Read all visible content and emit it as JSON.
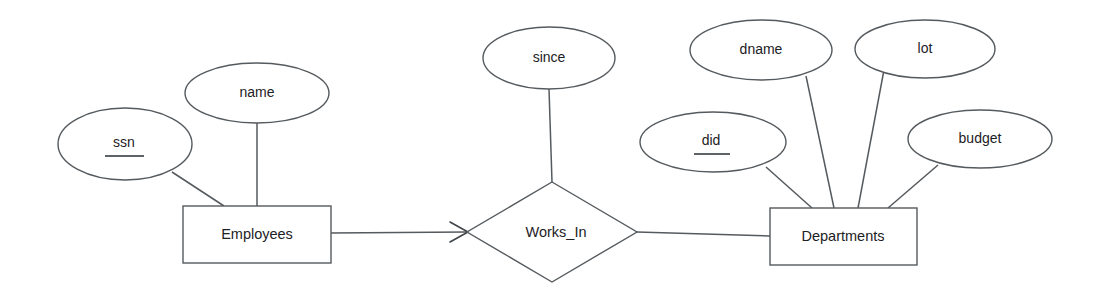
{
  "diagram": {
    "type": "entity-relationship-diagram",
    "background_color": "#ffffff",
    "stroke_color": "#555a5e",
    "text_color": "#1d2124",
    "entities": [
      {
        "id": "employees",
        "label": "Employees",
        "shape": "rectangle",
        "x": 183,
        "y": 206,
        "width": 148,
        "height": 57
      },
      {
        "id": "departments",
        "label": "Departments",
        "shape": "rectangle",
        "x": 770,
        "y": 208,
        "width": 147,
        "height": 57
      }
    ],
    "relationships": [
      {
        "id": "works_in",
        "label": "Works_In",
        "shape": "diamond",
        "cx": 552,
        "cy": 232,
        "rx": 85,
        "ry": 50
      }
    ],
    "attributes": [
      {
        "id": "ssn",
        "label": "ssn",
        "owner": "employees",
        "is_key": true,
        "cx": 125,
        "cy": 144,
        "rx": 67,
        "ry": 36
      },
      {
        "id": "name",
        "label": "name",
        "owner": "employees",
        "is_key": false,
        "cx": 257,
        "cy": 93,
        "rx": 72,
        "ry": 30
      },
      {
        "id": "since",
        "label": "since",
        "owner": "works_in",
        "is_key": false,
        "cx": 549,
        "cy": 58,
        "rx": 66,
        "ry": 31
      },
      {
        "id": "did",
        "label": "did",
        "owner": "departments",
        "is_key": true,
        "cx": 713,
        "cy": 142,
        "rx": 73,
        "ry": 30
      },
      {
        "id": "dname",
        "label": "dname",
        "owner": "departments",
        "is_key": false,
        "cx": 761,
        "cy": 50,
        "rx": 71,
        "ry": 30
      },
      {
        "id": "lot",
        "label": "lot",
        "owner": "departments",
        "is_key": false,
        "cx": 925,
        "cy": 49,
        "rx": 70,
        "ry": 29
      },
      {
        "id": "budget",
        "label": "budget",
        "owner": "departments",
        "is_key": false,
        "cx": 980,
        "cy": 139,
        "rx": 72,
        "ry": 29
      }
    ],
    "edges": [
      {
        "id": "employees-works_in",
        "from": "employees",
        "to": "works_in",
        "has_arrow": true,
        "arrow_at": "works_in"
      },
      {
        "id": "works_in-departments",
        "from": "works_in",
        "to": "departments",
        "has_arrow": false
      },
      {
        "id": "ssn-employees",
        "from": "ssn",
        "to": "employees",
        "has_arrow": false
      },
      {
        "id": "name-employees",
        "from": "name",
        "to": "employees",
        "has_arrow": false
      },
      {
        "id": "since-works_in",
        "from": "since",
        "to": "works_in",
        "has_arrow": false
      },
      {
        "id": "did-departments",
        "from": "did",
        "to": "departments",
        "has_arrow": false
      },
      {
        "id": "dname-departments",
        "from": "dname",
        "to": "departments",
        "has_arrow": false
      },
      {
        "id": "lot-departments",
        "from": "lot",
        "to": "departments",
        "has_arrow": false
      },
      {
        "id": "budget-departments",
        "from": "budget",
        "to": "departments",
        "has_arrow": false
      }
    ]
  }
}
